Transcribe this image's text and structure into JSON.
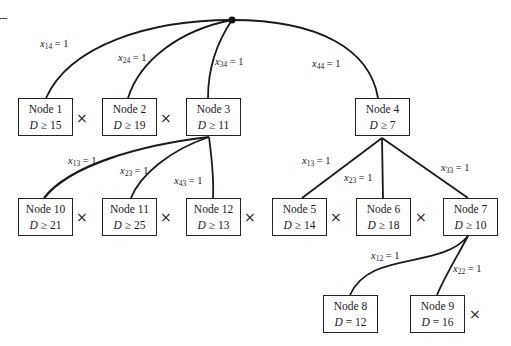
{
  "diagram": {
    "type": "branch-and-bound-tree",
    "root": {
      "position": [
        232,
        20
      ]
    },
    "nodes": [
      {
        "id": "node1",
        "label": "Node 1",
        "var": "D",
        "op": "≥",
        "bound": "15",
        "x": 18,
        "y": 98,
        "pruned": true
      },
      {
        "id": "node2",
        "label": "Node 2",
        "var": "D",
        "op": "≥",
        "bound": "19",
        "x": 102,
        "y": 98,
        "pruned": true
      },
      {
        "id": "node3",
        "label": "Node 3",
        "var": "D",
        "op": "≥",
        "bound": "11",
        "x": 186,
        "y": 98,
        "pruned": false
      },
      {
        "id": "node4",
        "label": "Node 4",
        "var": "D",
        "op": "≥",
        "bound": "7",
        "x": 355,
        "y": 98,
        "pruned": false
      },
      {
        "id": "node10",
        "label": "Node 10",
        "var": "D",
        "op": "≥",
        "bound": "21",
        "x": 18,
        "y": 198,
        "pruned": true
      },
      {
        "id": "node11",
        "label": "Node 11",
        "var": "D",
        "op": "≥",
        "bound": "25",
        "x": 102,
        "y": 198,
        "pruned": true
      },
      {
        "id": "node12",
        "label": "Node 12",
        "var": "D",
        "op": "≥",
        "bound": "13",
        "x": 186,
        "y": 198,
        "pruned": true
      },
      {
        "id": "node5",
        "label": "Node 5",
        "var": "D",
        "op": "≥",
        "bound": "14",
        "x": 272,
        "y": 198,
        "pruned": true
      },
      {
        "id": "node6",
        "label": "Node 6",
        "var": "D",
        "op": "≥",
        "bound": "18",
        "x": 356,
        "y": 198,
        "pruned": true
      },
      {
        "id": "node7",
        "label": "Node 7",
        "var": "D",
        "op": "≥",
        "bound": "10",
        "x": 443,
        "y": 198,
        "pruned": false
      },
      {
        "id": "node8",
        "label": "Node 8",
        "var": "D",
        "op": "=",
        "bound": "12",
        "x": 323,
        "y": 295,
        "pruned": false
      },
      {
        "id": "node9",
        "label": "Node 9",
        "var": "D",
        "op": "=",
        "bound": "16",
        "x": 410,
        "y": 295,
        "pruned": true
      }
    ],
    "edges": [
      {
        "from": "root",
        "to": "node1",
        "var": "x",
        "sub": "14",
        "eq": "= 1"
      },
      {
        "from": "root",
        "to": "node2",
        "var": "x",
        "sub": "24",
        "eq": "= 1"
      },
      {
        "from": "root",
        "to": "node3",
        "var": "x",
        "sub": "34",
        "eq": "= 1"
      },
      {
        "from": "root",
        "to": "node4",
        "var": "x",
        "sub": "44",
        "eq": "= 1"
      },
      {
        "from": "node3",
        "to": "node10",
        "var": "x",
        "sub": "13",
        "eq": "= 1"
      },
      {
        "from": "node3",
        "to": "node11",
        "var": "x",
        "sub": "23",
        "eq": "= 1"
      },
      {
        "from": "node3",
        "to": "node12",
        "var": "x",
        "sub": "43",
        "eq": "= 1"
      },
      {
        "from": "node4",
        "to": "node5",
        "var": "x",
        "sub": "13",
        "eq": "= 1"
      },
      {
        "from": "node4",
        "to": "node6",
        "var": "x",
        "sub": "23",
        "eq": "= 1"
      },
      {
        "from": "node4",
        "to": "node7",
        "var": "x",
        "sub": "33",
        "eq": "= 1"
      },
      {
        "from": "node7",
        "to": "node8",
        "var": "x",
        "sub": "12",
        "eq": "= 1"
      },
      {
        "from": "node7",
        "to": "node9",
        "var": "x",
        "sub": "22",
        "eq": "= 1"
      }
    ],
    "pruned_marker": "×",
    "colors": {
      "line": "#1a1a1a",
      "box_border": "#222222",
      "background": "#ffffff"
    }
  }
}
